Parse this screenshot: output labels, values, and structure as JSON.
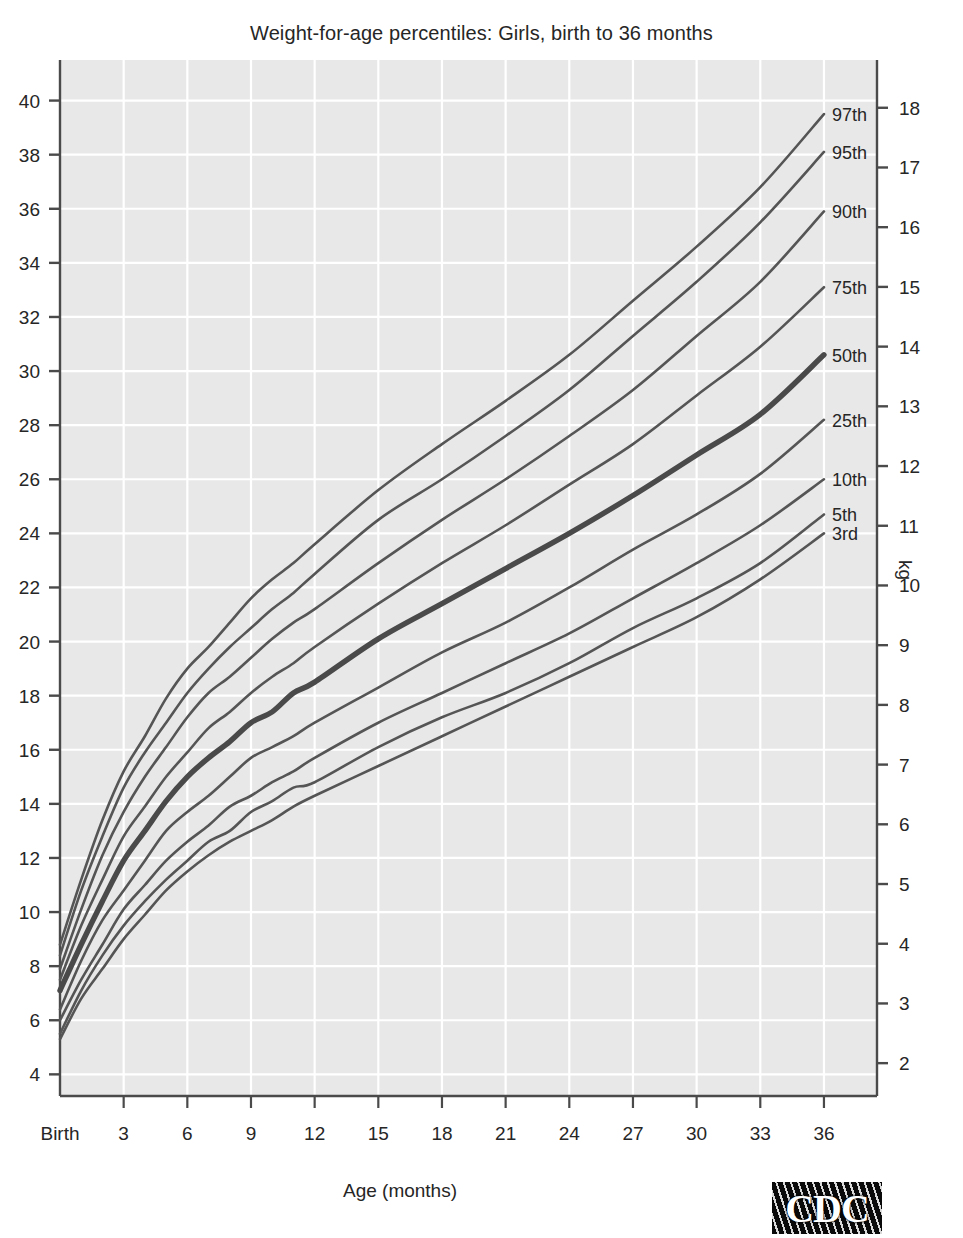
{
  "title": "Weight-for-age percentiles: Girls, birth to 36 months",
  "xlabel": "Age (months)",
  "ylabel_right": "kg",
  "logo": {
    "text": "CDC",
    "name": "cdc-logo"
  },
  "axes": {
    "x_ticks": [
      "Birth",
      "3",
      "6",
      "9",
      "12",
      "15",
      "18",
      "21",
      "24",
      "27",
      "30",
      "33",
      "36"
    ],
    "x_values": [
      0,
      3,
      6,
      9,
      12,
      15,
      18,
      21,
      24,
      27,
      30,
      33,
      36
    ],
    "y_left_ticks": [
      "40",
      "38",
      "36",
      "34",
      "32",
      "30",
      "28",
      "26",
      "24",
      "22",
      "20",
      "18",
      "16",
      "14",
      "12",
      "10",
      "8",
      "6",
      "4"
    ],
    "y_left_values": [
      40,
      38,
      36,
      34,
      32,
      30,
      28,
      26,
      24,
      22,
      20,
      18,
      16,
      14,
      12,
      10,
      8,
      6,
      4
    ],
    "y_right_ticks": [
      "18",
      "17",
      "16",
      "15",
      "14",
      "13",
      "12",
      "11",
      "10",
      "9",
      "8",
      "7",
      "6",
      "5",
      "4",
      "3",
      "2"
    ],
    "y_right_values": [
      18,
      17,
      16,
      15,
      14,
      13,
      12,
      11,
      10,
      9,
      8,
      7,
      6,
      5,
      4,
      3,
      2
    ],
    "x_unit": "months",
    "y_left_unit": "lb",
    "y_right_unit": "kg"
  },
  "style": {
    "plot_background": "#e8e8e8",
    "gridline_color": "#ffffff",
    "curve_color": "#555555",
    "median_curve_color": "#4a4a4a",
    "axis_color": "#4a4a4a",
    "page_background": "#ffffff"
  },
  "chart_data": {
    "type": "line",
    "title": "Weight-for-age percentiles: Girls, birth to 36 months",
    "xlabel": "Age (months)",
    "ylabel": "lb",
    "ylabel_secondary": "kg",
    "xlim": [
      0,
      38.5
    ],
    "ylim": [
      3.2,
      41.5
    ],
    "ylim_secondary": [
      1.45,
      18.8
    ],
    "grid": true,
    "legend_position": "right-inline-labels",
    "x": [
      0,
      1,
      2,
      3,
      4,
      5,
      6,
      7,
      8,
      9,
      10,
      11,
      12,
      15,
      18,
      21,
      24,
      27,
      30,
      33,
      36
    ],
    "series": [
      {
        "name": "97th",
        "label": "97th",
        "bold": false,
        "values_kg": [
          4.0,
          5.1,
          6.1,
          6.9,
          7.5,
          8.1,
          8.6,
          9.0,
          9.4,
          9.8,
          10.1,
          10.4,
          10.7,
          11.6,
          12.4,
          13.1,
          13.9,
          14.8,
          15.7,
          16.7,
          17.9
        ],
        "values_lb": [
          8.8,
          11.2,
          13.4,
          15.2,
          16.5,
          17.9,
          19.0,
          19.8,
          20.7,
          21.6,
          22.3,
          22.9,
          23.6,
          25.6,
          27.3,
          28.9,
          30.6,
          32.6,
          34.6,
          36.8,
          39.5
        ]
      },
      {
        "name": "95th",
        "label": "95th",
        "bold": false,
        "values_kg": [
          3.8,
          4.9,
          5.8,
          6.6,
          7.2,
          7.7,
          8.2,
          8.6,
          9.0,
          9.3,
          9.6,
          9.9,
          10.2,
          11.1,
          11.8,
          12.5,
          13.3,
          14.2,
          15.1,
          16.1,
          17.3
        ],
        "values_lb": [
          8.4,
          10.8,
          12.8,
          14.6,
          15.9,
          17.0,
          18.1,
          19.0,
          19.8,
          20.5,
          21.2,
          21.8,
          22.5,
          24.5,
          26.0,
          27.6,
          29.3,
          31.3,
          33.3,
          35.5,
          38.1
        ]
      },
      {
        "name": "90th",
        "label": "90th",
        "bold": false,
        "values_kg": [
          3.6,
          4.6,
          5.5,
          6.2,
          6.8,
          7.3,
          7.8,
          8.2,
          8.5,
          8.8,
          9.1,
          9.4,
          9.6,
          10.4,
          11.1,
          11.8,
          12.5,
          13.3,
          14.2,
          15.1,
          16.3
        ],
        "values_lb": [
          7.9,
          10.1,
          12.1,
          13.7,
          15.0,
          16.1,
          17.2,
          18.1,
          18.7,
          19.4,
          20.1,
          20.7,
          21.2,
          22.9,
          24.5,
          26.0,
          27.6,
          29.3,
          31.3,
          33.3,
          35.9
        ]
      },
      {
        "name": "75th",
        "label": "75th",
        "bold": false,
        "values_kg": [
          3.4,
          4.3,
          5.1,
          5.8,
          6.3,
          6.8,
          7.2,
          7.6,
          7.9,
          8.2,
          8.5,
          8.7,
          9.0,
          9.7,
          10.4,
          11.0,
          11.7,
          12.4,
          13.2,
          14.0,
          15.0
        ],
        "values_lb": [
          7.5,
          9.5,
          11.2,
          12.8,
          13.9,
          15.0,
          15.9,
          16.8,
          17.4,
          18.1,
          18.7,
          19.2,
          19.8,
          21.4,
          22.9,
          24.3,
          25.8,
          27.3,
          29.1,
          30.9,
          33.1
        ]
      },
      {
        "name": "50th",
        "label": "50th",
        "bold": true,
        "values_kg": [
          3.2,
          4.0,
          4.7,
          5.4,
          5.9,
          6.4,
          6.8,
          7.1,
          7.4,
          7.7,
          7.9,
          8.2,
          8.4,
          9.1,
          9.7,
          10.3,
          10.9,
          11.5,
          12.2,
          12.9,
          13.9
        ],
        "values_lb": [
          7.1,
          8.8,
          10.4,
          11.9,
          13.0,
          14.1,
          15.0,
          15.7,
          16.3,
          17.0,
          17.4,
          18.1,
          18.5,
          20.1,
          21.4,
          22.7,
          24.0,
          25.4,
          26.9,
          28.4,
          30.6
        ]
      },
      {
        "name": "25th",
        "label": "25th",
        "bold": false,
        "values_kg": [
          2.9,
          3.7,
          4.4,
          4.9,
          5.4,
          5.9,
          6.2,
          6.5,
          6.8,
          7.1,
          7.3,
          7.5,
          7.7,
          8.3,
          8.9,
          9.4,
          10.0,
          10.6,
          11.2,
          11.9,
          12.8
        ],
        "values_lb": [
          6.4,
          8.2,
          9.7,
          10.8,
          11.9,
          13.0,
          13.7,
          14.3,
          15.0,
          15.7,
          16.1,
          16.5,
          17.0,
          18.3,
          19.6,
          20.7,
          22.0,
          23.4,
          24.7,
          26.2,
          28.2
        ]
      },
      {
        "name": "10th",
        "label": "10th",
        "bold": false,
        "values_kg": [
          2.7,
          3.4,
          4.0,
          4.6,
          5.0,
          5.4,
          5.7,
          6.0,
          6.3,
          6.5,
          6.7,
          6.9,
          7.1,
          7.7,
          8.2,
          8.7,
          9.2,
          9.8,
          10.4,
          11.0,
          11.8
        ],
        "values_lb": [
          6.0,
          7.5,
          8.8,
          10.1,
          11.0,
          11.9,
          12.6,
          13.2,
          13.9,
          14.3,
          14.8,
          15.2,
          15.7,
          17.0,
          18.1,
          19.2,
          20.3,
          21.6,
          22.9,
          24.3,
          26.0
        ]
      },
      {
        "name": "5th",
        "label": "5th",
        "bold": false,
        "values_kg": [
          2.5,
          3.2,
          3.8,
          4.3,
          4.7,
          5.1,
          5.4,
          5.7,
          5.9,
          6.2,
          6.4,
          6.6,
          6.7,
          7.3,
          7.8,
          8.2,
          8.7,
          9.3,
          9.8,
          10.4,
          11.2
        ],
        "values_lb": [
          5.5,
          7.1,
          8.4,
          9.5,
          10.4,
          11.2,
          11.9,
          12.6,
          13.0,
          13.7,
          14.1,
          14.6,
          14.8,
          16.1,
          17.2,
          18.1,
          19.2,
          20.5,
          21.6,
          22.9,
          24.7
        ]
      },
      {
        "name": "3rd",
        "label": "3rd",
        "bold": false,
        "values_kg": [
          2.4,
          3.1,
          3.6,
          4.1,
          4.5,
          4.9,
          5.2,
          5.5,
          5.7,
          5.9,
          6.1,
          6.3,
          6.5,
          7.0,
          7.5,
          8.0,
          8.5,
          9.0,
          9.5,
          10.1,
          10.9
        ],
        "values_lb": [
          5.3,
          6.8,
          7.9,
          9.0,
          9.9,
          10.8,
          11.5,
          12.1,
          12.6,
          13.0,
          13.4,
          13.9,
          14.3,
          15.4,
          16.5,
          17.6,
          18.7,
          19.8,
          20.9,
          22.3,
          24.0
        ]
      }
    ]
  }
}
